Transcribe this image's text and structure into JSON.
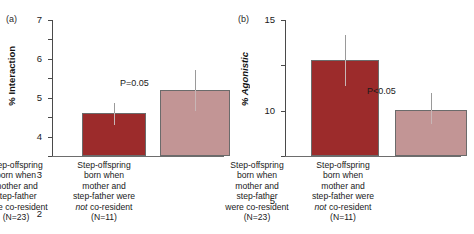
{
  "chart_data": [
    {
      "type": "bar",
      "panel_label": "(a)",
      "title": "",
      "xlabel": "",
      "ylabel": "% Interaction",
      "ylim": [
        0,
        7
      ],
      "yticks": [
        0,
        1,
        2,
        3,
        4,
        5,
        6,
        7
      ],
      "grid": false,
      "legend": "none",
      "categories": [
        "Step-offspring born when mother and step-father were co-resident (N=23)",
        "Step-offspring born when mother and step-father were not co-resident (N=11)"
      ],
      "category_lines": [
        [
          "Step-offspring",
          "born when",
          "mother and",
          "step-father",
          "were co-resident",
          "(N=23)"
        ],
        [
          "Step-offspring",
          "born when",
          "mother and",
          "step-father were",
          "not co-resident",
          "(N=11)"
        ]
      ],
      "values": [
        2.2,
        3.4
      ],
      "error_upper": [
        2.75,
        4.45
      ],
      "error_lower": [
        1.6,
        2.3
      ],
      "bar_colors": [
        "#9c2b2b",
        "#c29595"
      ],
      "annotation": "P=0.05"
    },
    {
      "type": "bar",
      "panel_label": "(b)",
      "title": "",
      "xlabel": "",
      "ylabel": "% Agonistic",
      "ylim": [
        0,
        15
      ],
      "yticks": [
        0,
        5,
        10,
        15
      ],
      "grid": false,
      "legend": "none",
      "categories": [
        "Step-offspring born when mother and step-father were co-resident (N=23)",
        "Step-offspring born when mother and step-father were not co-resident (N=11)"
      ],
      "category_lines": [
        [
          "Step-offspring",
          "born when",
          "mother and",
          "step-father",
          "were co-resident",
          "(N=23)"
        ],
        [
          "Step-offspring",
          "born when",
          "mother and",
          "step-father were",
          "not co-resident",
          "(N=11)"
        ]
      ],
      "values": [
        10.6,
        5.1
      ],
      "error_upper": [
        13.3,
        6.9
      ],
      "error_lower": [
        7.7,
        3.5
      ],
      "bar_colors": [
        "#9c2b2b",
        "#c29595"
      ],
      "annotation": "P<0.05"
    }
  ]
}
